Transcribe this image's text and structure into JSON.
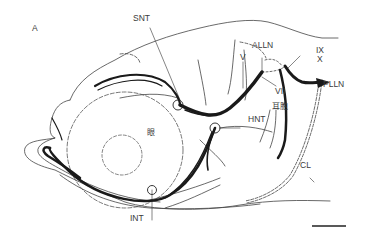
{
  "figure": {
    "panel_label": "A",
    "labels": {
      "snt": "SNT",
      "alln": "ALLN",
      "ix": "IX",
      "x": "X",
      "v": "V",
      "vii": "VII",
      "plln": "PLLN",
      "otic_vesicle": "耳胞",
      "eye": "眼",
      "hnt": "HNT",
      "cl": "CL",
      "int": "INT"
    },
    "scale_bar": {
      "label": ""
    },
    "colors": {
      "line": "#1a1a1a",
      "thin_line": "#444444",
      "text": "#3a3a3a",
      "background": "#ffffff"
    }
  }
}
